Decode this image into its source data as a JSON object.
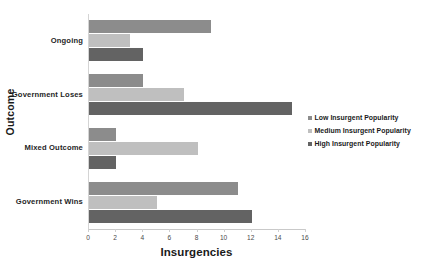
{
  "chart_data": {
    "type": "bar",
    "orientation": "horizontal",
    "title": "",
    "xlabel": "Insurgencies",
    "ylabel": "Outcome",
    "categories": [
      "Ongoing",
      "Government Loses",
      "Mixed Outcome",
      "Government Wins"
    ],
    "series": [
      {
        "name": "Low Insurgent Popularity",
        "color": "#8c8c8c",
        "values": [
          9,
          4,
          2,
          11
        ]
      },
      {
        "name": "Medium Insurgent Popularity",
        "color": "#bfbfbf",
        "values": [
          3,
          7,
          8,
          5
        ]
      },
      {
        "name": "High Insurgent Popularity",
        "color": "#636363",
        "values": [
          4,
          15,
          2,
          12
        ]
      }
    ],
    "xlim": [
      0,
      16
    ],
    "xticks": [
      0,
      2,
      4,
      6,
      8,
      10,
      12,
      14,
      16
    ],
    "xtick_labels": [
      "0",
      "2",
      "4",
      "6",
      "8",
      "10",
      "12",
      "14",
      "16"
    ],
    "grid": false,
    "legend_position": "right"
  },
  "axes": {
    "x_title": "Insurgencies",
    "y_title": "Outcome"
  },
  "legend": {
    "items": [
      {
        "label": "Low Insurgent Popularity",
        "color": "#8c8c8c"
      },
      {
        "label": "Medium Insurgent Popularity",
        "color": "#bfbfbf"
      },
      {
        "label": "High Insurgent Popularity",
        "color": "#636363"
      }
    ]
  }
}
